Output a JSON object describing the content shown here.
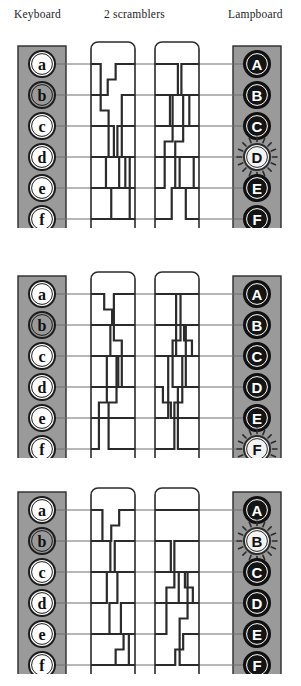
{
  "headers": {
    "keyboard": "Keyboard",
    "scramblers": "2 scramblers",
    "lampboard": "Lampboard"
  },
  "colors": {
    "background": "#ffffff",
    "board_gray": "#9a9a9a",
    "board_border": "#2b2b2b",
    "key_fill": "#ffffff",
    "key_pressed_fill": "#9a9a9a",
    "lamp_fill": "#141414",
    "lamp_lit_fill": "#f2f2f2",
    "wire": "#2b2b2b",
    "lead": "#6f6f6f",
    "text": "#1a1a1a"
  },
  "keyboard_labels": [
    "a",
    "b",
    "c",
    "d",
    "e",
    "f"
  ],
  "lampboard_labels": [
    "A",
    "B",
    "C",
    "D",
    "E",
    "F"
  ],
  "panels": [
    {
      "name": "panel-1",
      "pressed_key": "b",
      "lit_lamp": "D",
      "scramblers": 2
    },
    {
      "name": "panel-2",
      "pressed_key": "b",
      "lit_lamp": "F",
      "scramblers": 2
    },
    {
      "name": "panel-3",
      "pressed_key": "b",
      "lit_lamp": "B",
      "scramblers": 2
    }
  ],
  "chart_data": {
    "type": "diagram",
    "columns": [
      "Keyboard",
      "2 scramblers",
      "Lampboard"
    ],
    "rows": 6,
    "row_labels_input": [
      "a",
      "b",
      "c",
      "d",
      "e",
      "f"
    ],
    "row_labels_output": [
      "A",
      "B",
      "C",
      "D",
      "E",
      "F"
    ],
    "panels": [
      {
        "press": 1,
        "input": "b",
        "output": "D"
      },
      {
        "press": 2,
        "input": "b",
        "output": "F"
      },
      {
        "press": 3,
        "input": "b",
        "output": "B"
      }
    ],
    "note": "Same key b pressed three times yields different lamps D, F, B because the scramblers step between presses."
  }
}
